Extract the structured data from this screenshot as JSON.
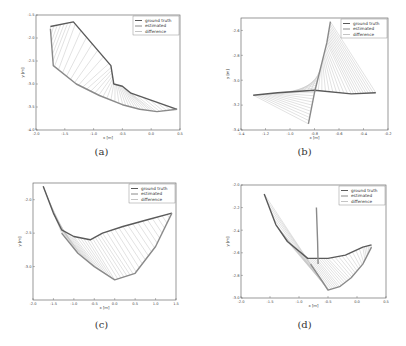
{
  "figure": {
    "panels": [
      {
        "id": "a",
        "caption": "(a)"
      },
      {
        "id": "b",
        "caption": "(b)"
      },
      {
        "id": "c",
        "caption": "(c)"
      },
      {
        "id": "d",
        "caption": "(d)"
      }
    ],
    "legend": [
      "ground truth",
      "estimated",
      "difference"
    ],
    "colors": {
      "ground_truth": "#5a5a5a",
      "estimated": "#8a8a8a",
      "difference": "#c4c4c4",
      "axis": "#555555"
    }
  },
  "chart_data": [
    {
      "type": "line",
      "panel": "a",
      "title": "",
      "xlabel": "x [m]",
      "ylabel": "y [m]",
      "xlim": [
        -2.0,
        0.5
      ],
      "ylim": [
        -4.0,
        -1.5
      ],
      "xticks": [
        "-2.0",
        "-1.5",
        "-1.0",
        "-0.5",
        "0.0",
        "0.5"
      ],
      "yticks": [
        "-1.5",
        "-2.0",
        "-2.5",
        "-3.0",
        "-3.5",
        "-4.0"
      ],
      "legend": [
        "ground truth",
        "estimated",
        "difference"
      ],
      "legend_position": "upper right",
      "grid": false,
      "series": [
        {
          "name": "ground truth",
          "x": [
            -1.75,
            -1.35,
            -0.7,
            -0.65,
            -0.5,
            -0.35,
            0.45
          ],
          "y": [
            -1.75,
            -1.65,
            -2.6,
            -3.0,
            -3.05,
            -3.2,
            -3.55
          ]
        },
        {
          "name": "estimated",
          "x": [
            -1.75,
            -1.7,
            -1.3,
            -0.9,
            -0.5,
            -0.2,
            0.1,
            0.45
          ],
          "y": [
            -1.8,
            -2.6,
            -3.0,
            -3.25,
            -3.45,
            -3.55,
            -3.6,
            -3.55
          ]
        }
      ]
    },
    {
      "type": "line",
      "panel": "b",
      "title": "",
      "xlabel": "x [m]",
      "ylabel": "y [m]",
      "xlim": [
        -1.4,
        -0.2
      ],
      "ylim": [
        -3.4,
        -2.5
      ],
      "xticks": [
        "-1.4",
        "-1.2",
        "-1.0",
        "-0.8",
        "-0.6",
        "-0.4",
        "-0.2"
      ],
      "yticks": [
        "-2.6",
        "-2.8",
        "-3.0",
        "-3.2",
        "-3.4"
      ],
      "legend": [
        "ground truth",
        "estimated",
        "difference"
      ],
      "legend_position": "upper right",
      "grid": false,
      "series": [
        {
          "name": "ground truth",
          "x": [
            -1.3,
            -1.1,
            -0.8,
            -0.5,
            -0.3
          ],
          "y": [
            -3.12,
            -3.1,
            -3.08,
            -3.11,
            -3.1
          ]
        },
        {
          "name": "estimated",
          "x": [
            -0.85,
            -0.8,
            -0.75,
            -0.7,
            -0.67
          ],
          "y": [
            -3.35,
            -3.1,
            -2.9,
            -2.7,
            -2.53
          ]
        }
      ]
    },
    {
      "type": "line",
      "panel": "c",
      "title": "",
      "xlabel": "x [m]",
      "ylabel": "y [m]",
      "xlim": [
        -2.0,
        1.5
      ],
      "ylim": [
        -3.5,
        -1.75
      ],
      "xticks": [
        "-2.0",
        "-1.5",
        "-1.0",
        "-0.5",
        "0.0",
        "0.5",
        "1.0",
        "1.5"
      ],
      "yticks": [
        "-2.0",
        "-2.5",
        "-3.0"
      ],
      "legend": [
        "ground truth",
        "estimated",
        "difference"
      ],
      "legend_position": "upper right",
      "grid": false,
      "series": [
        {
          "name": "ground truth",
          "x": [
            -1.75,
            -1.5,
            -1.3,
            -1.0,
            -0.6,
            -0.3,
            0.2,
            0.8,
            1.4
          ],
          "y": [
            -1.8,
            -2.2,
            -2.45,
            -2.55,
            -2.6,
            -2.5,
            -2.4,
            -2.3,
            -2.2
          ]
        },
        {
          "name": "estimated",
          "x": [
            -1.3,
            -0.9,
            -0.5,
            0.0,
            0.5,
            1.0,
            1.4
          ],
          "y": [
            -2.5,
            -2.8,
            -3.0,
            -3.2,
            -3.1,
            -2.7,
            -2.2
          ]
        }
      ]
    },
    {
      "type": "line",
      "panel": "d",
      "title": "",
      "xlabel": "x [m]",
      "ylabel": "y [m]",
      "xlim": [
        -2.0,
        0.5
      ],
      "ylim": [
        -3.0,
        -2.0
      ],
      "xticks": [
        "-2.0",
        "-1.5",
        "-1.0",
        "-0.5",
        "0.0",
        "0.5"
      ],
      "yticks": [
        "-2.0",
        "-2.2",
        "-2.4",
        "-2.6",
        "-2.8",
        "-3.0"
      ],
      "legend": [
        "ground truth",
        "estimated",
        "difference"
      ],
      "legend_position": "upper right",
      "grid": false,
      "series": [
        {
          "name": "ground truth",
          "x": [
            -1.6,
            -1.4,
            -1.2,
            -0.85,
            -0.7,
            -0.5,
            -0.2,
            0.1,
            0.25
          ],
          "y": [
            -2.08,
            -2.35,
            -2.5,
            -2.65,
            -2.65,
            -2.65,
            -2.62,
            -2.55,
            -2.53
          ]
        },
        {
          "name": "estimated",
          "x": [
            -0.8,
            -0.6,
            -0.5,
            -0.3,
            -0.1,
            0.1,
            0.25
          ],
          "y": [
            -2.7,
            -2.85,
            -2.93,
            -2.9,
            -2.82,
            -2.7,
            -2.55
          ]
        },
        {
          "name": "vertical segment",
          "x": [
            -0.7,
            -0.68,
            -0.67
          ],
          "y": [
            -2.2,
            -2.5,
            -2.7
          ]
        }
      ]
    }
  ]
}
